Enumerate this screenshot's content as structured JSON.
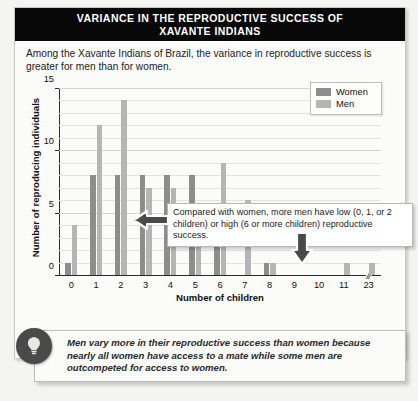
{
  "title": {
    "line1": "VARIANCE IN THE REPRODUCTIVE SUCCESS OF",
    "line2": "XAVANTE INDIANS"
  },
  "intro": "Among the Xavante Indians of Brazil, the variance in reproductive success is greater for men than for women.",
  "annotation": {
    "text": "Compared with women, more men have low (0, 1, or 2 children) or high (6 or more children) reproductive success.",
    "arrow_left_icon": "arrow-left-icon",
    "arrow_down_icon": "arrow-down-icon"
  },
  "tip": {
    "icon": "lightbulb-icon",
    "text": "Men vary more in their reproductive success than women because nearly all women have access to a mate while some men are outcompeted for access to women."
  },
  "chart_data": {
    "type": "bar",
    "title": "VARIANCE IN THE REPRODUCTIVE SUCCESS OF XAVANTE INDIANS",
    "xlabel": "Number of children",
    "ylabel": "Number of reproducing individuals",
    "categories": [
      "0",
      "1",
      "2",
      "3",
      "4",
      "5",
      "6",
      "7",
      "8",
      "9",
      "10",
      "11",
      "23"
    ],
    "axis_break_after_category": "11",
    "axis_break_symbol": "//",
    "ylim": [
      0,
      15
    ],
    "yticks": [
      0,
      5,
      10,
      15
    ],
    "ytick_labels": [
      "0",
      "5",
      "10",
      "15"
    ],
    "grid": true,
    "legend_position": "top-right",
    "series": [
      {
        "name": "Women",
        "color": "#8d8d8d",
        "values": [
          1,
          8,
          8,
          8,
          8,
          8,
          4,
          0,
          1,
          0,
          0,
          0,
          0
        ]
      },
      {
        "name": "Men",
        "color": "#b5b5b5",
        "values": [
          4,
          12,
          14,
          7,
          7,
          3,
          9,
          6,
          1,
          0,
          0,
          1,
          1
        ]
      }
    ]
  },
  "colors": {
    "title_bar_bg": "#080808",
    "title_bar_text": "#ffffff",
    "women": "#8d8d8d",
    "men": "#b5b5b5",
    "page_bg": "#f4f4f2",
    "card_bg": "#fbfbfa"
  }
}
